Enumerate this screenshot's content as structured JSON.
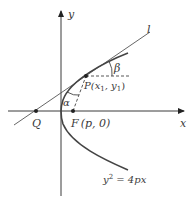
{
  "figure": {
    "labels": {
      "x_axis": "x",
      "y_axis": "y",
      "tangent_line": "l",
      "angle_beta": "β",
      "angle_alpha": "α",
      "point_p": "P(x",
      "point_p_sub1": "1",
      "point_p_mid": ", y",
      "point_p_sub2": "1",
      "point_p_end": ")",
      "point_q": "Q",
      "focus_f": "F",
      "focus_coords": "(p, 0)",
      "equation_y": "y",
      "equation_exp": "2",
      "equation_rest": " = 4px"
    },
    "colors": {
      "stroke": "#3a3a3a",
      "curve": "#444444",
      "background": "#ffffff"
    }
  }
}
